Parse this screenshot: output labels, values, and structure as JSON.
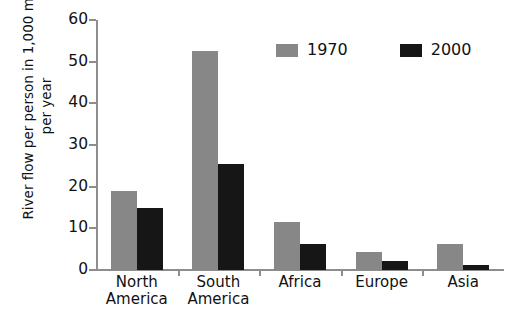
{
  "title_cutoff": "",
  "legend": {
    "position": "top-center",
    "items": [
      {
        "label": "1970",
        "color": "#878787",
        "swatch_name": "legend-swatch-1970"
      },
      {
        "label": "2000",
        "color": "#161616",
        "swatch_name": "legend-swatch-2000"
      }
    ]
  },
  "yaxis": {
    "title_line1": "River flow per person in 1,000 m",
    "title_exponent": "3",
    "title_line2": "per year",
    "ticks": [
      "0",
      "10",
      "20",
      "30",
      "40",
      "50",
      "60"
    ]
  },
  "xaxis": {
    "categories": [
      {
        "line1": "North",
        "line2": "America"
      },
      {
        "line1": "South",
        "line2": "America"
      },
      {
        "line1": "Africa",
        "line2": ""
      },
      {
        "line1": "Europe",
        "line2": ""
      },
      {
        "line1": "Asia",
        "line2": ""
      }
    ]
  },
  "chart_data": {
    "type": "bar",
    "categories": [
      "North America",
      "South America",
      "Africa",
      "Europe",
      "Asia"
    ],
    "series": [
      {
        "name": "1970",
        "color": "#878787",
        "values": [
          19,
          52.5,
          11.5,
          4.3,
          6.2
        ]
      },
      {
        "name": "2000",
        "color": "#161616",
        "values": [
          15,
          25.4,
          6.3,
          2.2,
          1.2
        ]
      }
    ],
    "xlabel": "",
    "ylabel": "River flow per person in 1,000 m3 per year",
    "ylim": [
      0,
      60
    ],
    "ytick_step": 10,
    "grid": false,
    "legend_position": "top-center"
  }
}
